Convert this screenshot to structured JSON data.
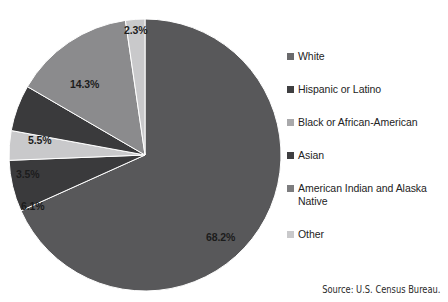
{
  "chart_data": {
    "type": "pie",
    "title": "",
    "subtitle": "",
    "xlabel": "",
    "ylabel": "",
    "legend_position": "right",
    "grid": false,
    "start_angle_deg": 0,
    "direction": "clockwise",
    "categories": [
      "White",
      "Hispanic or Latino",
      "American Indian and Alaska Native",
      "Asian",
      "Black or African-American",
      "Other"
    ],
    "values": [
      68.2,
      6.1,
      3.5,
      5.5,
      14.3,
      2.3
    ],
    "value_labels": [
      "68.2%",
      "6.1%",
      "3.5%",
      "5.5%",
      "14.3%",
      "2.3%"
    ],
    "colors": [
      "#58585a",
      "#3a3a3c",
      "#c9c9cb",
      "#3a3a3c",
      "#8b8b8d",
      "#c9c9cb"
    ],
    "annotations": [
      "Source: U.S. Census Bureau."
    ]
  },
  "pie": {
    "slices": [
      {
        "name": "White",
        "label": "68.2%",
        "value": 68.2,
        "color": "#58585a",
        "label_x": 198,
        "label_y": 213
      },
      {
        "name": "Hispanic or Latino",
        "label": "6.1%",
        "value": 6.1,
        "color": "#3a3a3c",
        "label_x": 13,
        "label_y": 182
      },
      {
        "name": "American Indian and Alaska Native",
        "label": "3.5%",
        "value": 3.5,
        "color": "#c9c9cb",
        "label_x": 8,
        "label_y": 150
      },
      {
        "name": "Asian",
        "label": "5.5%",
        "value": 5.5,
        "color": "#3a3a3c",
        "label_x": 20,
        "label_y": 116
      },
      {
        "name": "Black or African-American",
        "label": "14.3%",
        "value": 14.3,
        "color": "#8b8b8d",
        "label_x": 62,
        "label_y": 60
      },
      {
        "name": "Other",
        "label": "2.3%",
        "value": 2.3,
        "color": "#c9c9cb",
        "label_x": 116,
        "label_y": 6
      }
    ]
  },
  "legend": {
    "items": [
      {
        "label": "White",
        "color": "#6a6a6c"
      },
      {
        "label": "Hispanic or Latino",
        "color": "#3f3f41"
      },
      {
        "label": "Black or African-American",
        "color": "#a9a9ab"
      },
      {
        "label": "Asian",
        "color": "#3f3f41"
      },
      {
        "label": "American Indian and Alaska Native",
        "color": "#7d7d7f"
      },
      {
        "label": "Other",
        "color": "#c9c9cb"
      }
    ]
  },
  "source": {
    "text": "Source: U.S. Census Bureau."
  }
}
